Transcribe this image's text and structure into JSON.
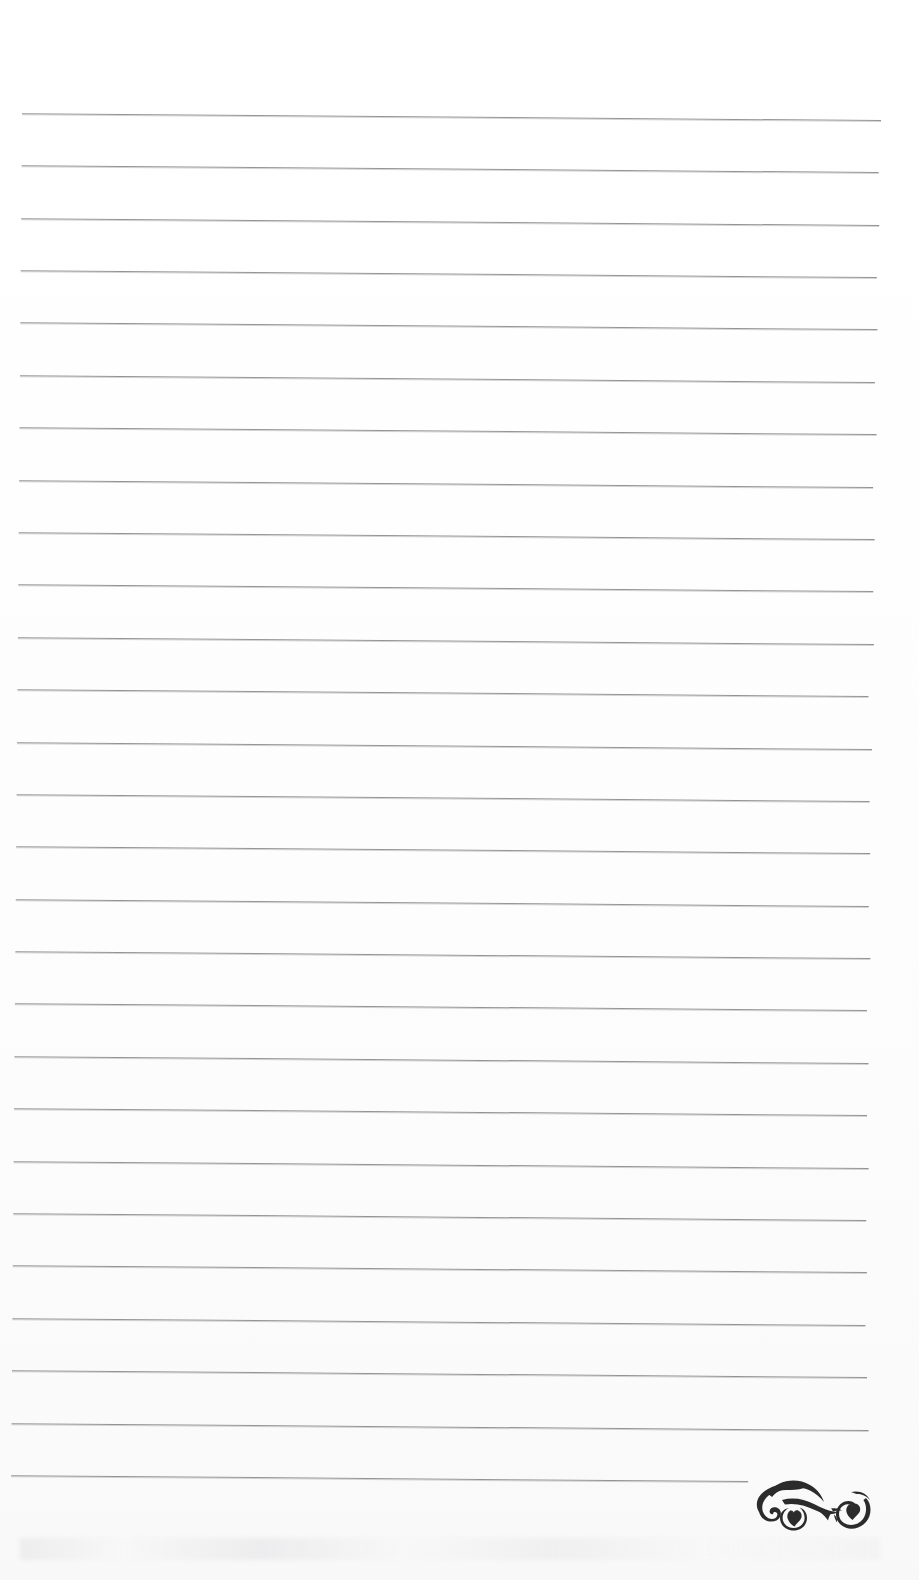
{
  "page": {
    "kind": "scanned-lined-notepad-page",
    "width": 919,
    "height": 1580,
    "background_color": "#fefefe",
    "has_text": false,
    "text_content": ""
  },
  "ruling": {
    "line_color": "#8b8b8d",
    "line_count": 27,
    "first_line_y": 113,
    "line_spacing": 52.4,
    "left_margin_x": 23,
    "right_margin_x": 882,
    "skew_degrees": 0.46,
    "description": "Evenly spaced horizontal ruled writing lines, slightly skewed from scanning",
    "lines": [
      {
        "index": 1,
        "y": 113,
        "x_start": 23,
        "x_end": 882
      },
      {
        "index": 2,
        "y": 165,
        "x_start": 23,
        "x_end": 880
      },
      {
        "index": 3,
        "y": 218,
        "x_start": 23,
        "x_end": 881
      },
      {
        "index": 4,
        "y": 270,
        "x_start": 23,
        "x_end": 879
      },
      {
        "index": 5,
        "y": 322,
        "x_start": 23,
        "x_end": 880
      },
      {
        "index": 6,
        "y": 375,
        "x_start": 23,
        "x_end": 878
      },
      {
        "index": 7,
        "y": 427,
        "x_start": 23,
        "x_end": 880
      },
      {
        "index": 8,
        "y": 480,
        "x_start": 23,
        "x_end": 877
      },
      {
        "index": 9,
        "y": 532,
        "x_start": 23,
        "x_end": 879
      },
      {
        "index": 10,
        "y": 584,
        "x_start": 23,
        "x_end": 878
      },
      {
        "index": 11,
        "y": 637,
        "x_start": 23,
        "x_end": 879
      },
      {
        "index": 12,
        "y": 689,
        "x_start": 23,
        "x_end": 874
      },
      {
        "index": 13,
        "y": 742,
        "x_start": 23,
        "x_end": 878
      },
      {
        "index": 14,
        "y": 794,
        "x_start": 23,
        "x_end": 876
      },
      {
        "index": 15,
        "y": 846,
        "x_start": 23,
        "x_end": 877
      },
      {
        "index": 16,
        "y": 899,
        "x_start": 23,
        "x_end": 876
      },
      {
        "index": 17,
        "y": 951,
        "x_start": 23,
        "x_end": 878
      },
      {
        "index": 18,
        "y": 1003,
        "x_start": 23,
        "x_end": 875
      },
      {
        "index": 19,
        "y": 1056,
        "x_start": 23,
        "x_end": 877
      },
      {
        "index": 20,
        "y": 1108,
        "x_start": 23,
        "x_end": 876
      },
      {
        "index": 21,
        "y": 1161,
        "x_start": 23,
        "x_end": 878
      },
      {
        "index": 22,
        "y": 1213,
        "x_start": 23,
        "x_end": 876
      },
      {
        "index": 23,
        "y": 1265,
        "x_start": 23,
        "x_end": 877
      },
      {
        "index": 24,
        "y": 1318,
        "x_start": 23,
        "x_end": 876
      },
      {
        "index": 25,
        "y": 1370,
        "x_start": 23,
        "x_end": 878
      },
      {
        "index": 26,
        "y": 1423,
        "x_start": 23,
        "x_end": 880
      },
      {
        "index": 27,
        "y": 1475,
        "x_start": 23,
        "x_end": 760
      }
    ]
  },
  "ornament": {
    "name": "calligraphic-flourish",
    "description": "Decorative black calligraphic scroll flourish with two spiral curls and heart-shaped leaf fills, at the terminus of the final ruled line",
    "color": "#2b2b2b",
    "x": 748,
    "y": 1468,
    "width": 130,
    "height": 74
  }
}
